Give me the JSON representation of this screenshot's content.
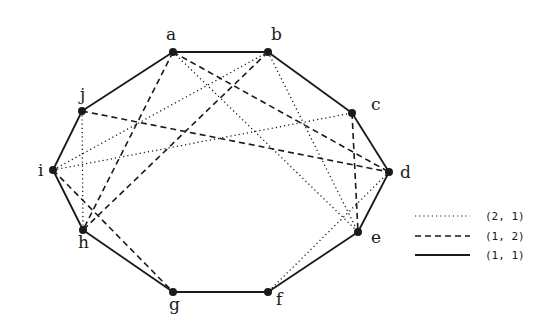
{
  "diagram": {
    "type": "graph",
    "vertices": [
      {
        "id": "a",
        "label": "a",
        "x": 173,
        "y": 52,
        "lx": 166,
        "ly": 40
      },
      {
        "id": "b",
        "label": "b",
        "x": 268,
        "y": 52,
        "lx": 271,
        "ly": 40
      },
      {
        "id": "c",
        "label": "c",
        "x": 352,
        "y": 113,
        "lx": 371,
        "ly": 110
      },
      {
        "id": "d",
        "label": "d",
        "x": 389,
        "y": 172,
        "lx": 400,
        "ly": 178
      },
      {
        "id": "e",
        "label": "e",
        "x": 358,
        "y": 232,
        "lx": 371,
        "ly": 243
      },
      {
        "id": "f",
        "label": "f",
        "x": 268,
        "y": 292,
        "lx": 276,
        "ly": 305
      },
      {
        "id": "g",
        "label": "g",
        "x": 173,
        "y": 292,
        "lx": 169,
        "ly": 310
      },
      {
        "id": "h",
        "label": "h",
        "x": 83,
        "y": 230,
        "lx": 78,
        "ly": 248
      },
      {
        "id": "i",
        "label": "i",
        "x": 53,
        "y": 170,
        "lx": 38,
        "ly": 176
      },
      {
        "id": "j",
        "label": "j",
        "x": 82,
        "y": 111,
        "lx": 80,
        "ly": 100
      }
    ],
    "edges": {
      "solid": [
        [
          "a",
          "b"
        ],
        [
          "b",
          "c"
        ],
        [
          "c",
          "d"
        ],
        [
          "d",
          "e"
        ],
        [
          "e",
          "f"
        ],
        [
          "f",
          "g"
        ],
        [
          "g",
          "h"
        ],
        [
          "h",
          "i"
        ],
        [
          "i",
          "j"
        ],
        [
          "j",
          "a"
        ]
      ],
      "dashed": [
        [
          "a",
          "h"
        ],
        [
          "a",
          "d"
        ],
        [
          "b",
          "h"
        ],
        [
          "j",
          "d"
        ],
        [
          "c",
          "e"
        ],
        [
          "i",
          "g"
        ]
      ],
      "dotted": [
        [
          "a",
          "e"
        ],
        [
          "b",
          "e"
        ],
        [
          "b",
          "i"
        ],
        [
          "j",
          "h"
        ],
        [
          "i",
          "c"
        ],
        [
          "d",
          "f"
        ]
      ]
    },
    "legend": [
      {
        "style": "dotted",
        "label": "(2, 1)"
      },
      {
        "style": "dashed",
        "label": "(1, 2)"
      },
      {
        "style": "solid",
        "label": "(1, 1)"
      }
    ],
    "colors": {
      "stroke": "#1a1a1a",
      "background": "#ffffff"
    }
  }
}
